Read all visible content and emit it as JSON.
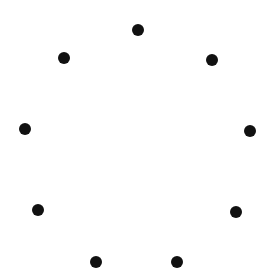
{
  "canvas": {
    "width": 261,
    "height": 264,
    "background": "#ffffff"
  },
  "dot_style": {
    "color": "#111111",
    "diameter": 12
  },
  "dots": [
    {
      "x": 138,
      "y": 30
    },
    {
      "x": 212,
      "y": 60
    },
    {
      "x": 250,
      "y": 131
    },
    {
      "x": 236,
      "y": 212
    },
    {
      "x": 177,
      "y": 262
    },
    {
      "x": 96,
      "y": 262
    },
    {
      "x": 38,
      "y": 210
    },
    {
      "x": 25,
      "y": 129
    },
    {
      "x": 64,
      "y": 58
    }
  ]
}
